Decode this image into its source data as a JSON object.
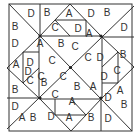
{
  "figure": {
    "type": "pinwheel-tangram-puzzle",
    "line_color": "#333333",
    "background": "#ffffff",
    "labels": [
      {
        "t": "D",
        "x": 31,
        "y": 17
      },
      {
        "t": "B",
        "x": 15,
        "y": 30
      },
      {
        "t": "B",
        "x": 47,
        "y": 16
      },
      {
        "t": "A",
        "x": 69,
        "y": 17
      },
      {
        "t": "D",
        "x": 91,
        "y": 17
      },
      {
        "t": "C",
        "x": 55,
        "y": 31
      },
      {
        "t": "D",
        "x": 78,
        "y": 32
      },
      {
        "t": "A",
        "x": 89,
        "y": 37
      },
      {
        "t": "B",
        "x": 107,
        "y": 16
      },
      {
        "t": "D",
        "x": 124,
        "y": 31
      },
      {
        "t": "D",
        "x": 15,
        "y": 47
      },
      {
        "t": "A",
        "x": 40,
        "y": 47
      },
      {
        "t": "B",
        "x": 61,
        "y": 47
      },
      {
        "t": "C",
        "x": 75,
        "y": 50
      },
      {
        "t": "D",
        "x": 100,
        "y": 61
      },
      {
        "t": "C",
        "x": 88,
        "y": 61
      },
      {
        "t": "B",
        "x": 123,
        "y": 58
      },
      {
        "t": "A",
        "x": 16,
        "y": 68
      },
      {
        "t": "D",
        "x": 30,
        "y": 66
      },
      {
        "t": "C",
        "x": 52,
        "y": 64
      },
      {
        "t": "B",
        "x": 44,
        "y": 86
      },
      {
        "t": "C",
        "x": 63,
        "y": 80
      },
      {
        "t": "D",
        "x": 104,
        "y": 80
      },
      {
        "t": "C",
        "x": 41,
        "y": 80
      },
      {
        "t": "A",
        "x": 93,
        "y": 90
      },
      {
        "t": "C",
        "x": 117,
        "y": 74
      },
      {
        "t": "A",
        "x": 120,
        "y": 94
      },
      {
        "t": "D",
        "x": 28,
        "y": 75
      },
      {
        "t": "B",
        "x": 15,
        "y": 93
      },
      {
        "t": "C",
        "x": 30,
        "y": 84
      },
      {
        "t": "B",
        "x": 77,
        "y": 90
      },
      {
        "t": "C",
        "x": 55,
        "y": 98
      },
      {
        "t": "A",
        "x": 72,
        "y": 105
      },
      {
        "t": "D",
        "x": 108,
        "y": 101
      },
      {
        "t": "D",
        "x": 15,
        "y": 110
      },
      {
        "t": "B",
        "x": 33,
        "y": 121
      },
      {
        "t": "D",
        "x": 51,
        "y": 120
      },
      {
        "t": "A",
        "x": 69,
        "y": 121
      },
      {
        "t": "B",
        "x": 91,
        "y": 121
      },
      {
        "t": "D",
        "x": 108,
        "y": 122
      },
      {
        "t": "B",
        "x": 124,
        "y": 108
      },
      {
        "t": "A",
        "x": 22,
        "y": 121
      }
    ]
  }
}
